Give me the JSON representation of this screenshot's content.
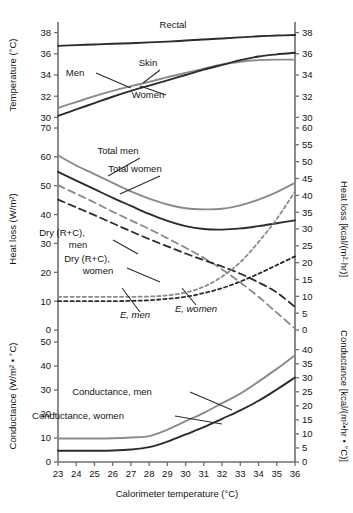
{
  "chart_data": {
    "type": "line",
    "title": "",
    "xlabel": "Calorimeter temperature (°C)",
    "xlim": [
      23,
      36
    ],
    "xticks": [
      23,
      24,
      25,
      26,
      27,
      28,
      29,
      30,
      31,
      32,
      33,
      34,
      35,
      36
    ],
    "x": [
      23,
      24,
      25,
      26,
      27,
      28,
      29,
      30,
      31,
      32,
      33,
      34,
      35,
      36
    ],
    "panels": [
      {
        "id": "temperature",
        "ylabel_left": "Temperature (°C)",
        "ylabel_right": "",
        "ylim_left": [
          29,
          39
        ],
        "yticks_left": [
          30,
          32,
          34,
          36,
          38
        ],
        "ylim_right": [
          29,
          39
        ],
        "yticks_right": [
          30,
          32,
          34,
          36,
          38
        ],
        "series": [
          {
            "name": "Rectal",
            "label": "Rectal",
            "style": "solid",
            "color": "#2b2b2b",
            "values": [
              36.75,
              36.82,
              36.88,
              36.95,
              37.0,
              37.08,
              37.15,
              37.25,
              37.35,
              37.45,
              37.55,
              37.65,
              37.72,
              37.78
            ]
          },
          {
            "name": "Skin, men",
            "label": "Men",
            "style": "solid",
            "color": "#8a8a8a",
            "values": [
              30.9,
              31.45,
              32.0,
              32.5,
              32.95,
              33.35,
              33.8,
              34.2,
              34.6,
              35.0,
              35.25,
              35.4,
              35.45,
              35.45
            ]
          },
          {
            "name": "Skin, women",
            "label": "Women",
            "style": "solid",
            "color": "#2b2b2b",
            "values": [
              30.15,
              30.75,
              31.35,
              31.95,
              32.5,
              33.0,
              33.5,
              34.0,
              34.5,
              34.95,
              35.4,
              35.75,
              35.95,
              36.1
            ]
          }
        ],
        "annotations": [
          {
            "text": "Rectal",
            "x": 173,
            "y": 28
          },
          {
            "text": "Skin",
            "x": 148,
            "y": 66
          },
          {
            "text": "Men",
            "x": 75,
            "y": 76
          },
          {
            "text": "Women",
            "x": 148,
            "y": 98
          }
        ]
      },
      {
        "id": "heat-loss",
        "ylabel_left": "Heat loss (W/m²)",
        "ylabel_right": "Heat loss [kcal/(m²·hr)]",
        "ylim_left": [
          0,
          70
        ],
        "yticks_left": [
          0,
          10,
          20,
          30,
          40,
          50,
          60,
          70
        ],
        "ylim_right": [
          0,
          60
        ],
        "yticks_right": [
          0,
          5,
          10,
          15,
          20,
          25,
          30,
          35,
          40,
          45,
          50,
          55,
          60
        ],
        "series": [
          {
            "name": "Total men",
            "label": "Total men",
            "style": "solid",
            "color": "#8a8a8a",
            "values": [
              60.5,
              57.0,
              54.0,
              51.0,
              48.0,
              45.5,
              43.5,
              42.2,
              41.8,
              42.0,
              43.2,
              45.2,
              47.8,
              51.0
            ]
          },
          {
            "name": "Total women",
            "label": "Total women",
            "style": "solid",
            "color": "#2b2b2b",
            "values": [
              54.8,
              51.8,
              48.8,
              45.8,
              43.0,
              40.2,
              37.8,
              36.0,
              35.0,
              34.8,
              35.2,
              36.0,
              37.0,
              38.0
            ]
          },
          {
            "name": "Dry (R+C), men",
            "label": "Dry (R+C), men",
            "style": "dashed",
            "color": "#8a8a8a",
            "values": [
              50.2,
              47.2,
              44.2,
              41.0,
              38.0,
              35.0,
              31.8,
              28.5,
              25.0,
              21.0,
              16.5,
              11.5,
              6.0,
              0.5
            ]
          },
          {
            "name": "Dry (R+C), women",
            "label": "Dry (R+C), women",
            "style": "dashed",
            "color": "#2b2b2b",
            "values": [
              45.2,
              42.5,
              39.8,
              37.0,
              34.2,
              31.5,
              29.0,
              26.5,
              24.2,
              22.0,
              19.5,
              16.5,
              13.0,
              8.0
            ]
          },
          {
            "name": "E, men",
            "label": "E, men",
            "style": "dotted",
            "color": "#8a8a8a",
            "values": [
              11.5,
              11.5,
              11.5,
              11.5,
              11.5,
              11.6,
              12.0,
              13.0,
              15.0,
              18.5,
              23.5,
              30.5,
              38.5,
              48.0
            ]
          },
          {
            "name": "E, women",
            "label": "E, women",
            "style": "dotted",
            "color": "#2b2b2b",
            "values": [
              10.0,
              10.0,
              10.0,
              10.0,
              10.1,
              10.3,
              10.8,
              11.5,
              12.8,
              14.5,
              16.8,
              19.5,
              22.5,
              25.5
            ]
          }
        ],
        "annotations": [
          {
            "text": "Total men",
            "x": 118,
            "y": 154
          },
          {
            "text": "Total women",
            "x": 135,
            "y": 172
          },
          {
            "text": "Dry (R+C),",
            "x": 62,
            "y": 236
          },
          {
            "text": "men",
            "x": 78,
            "y": 248
          },
          {
            "text": "Dry (R+C),",
            "x": 87,
            "y": 262
          },
          {
            "text": "women",
            "x": 98,
            "y": 274
          },
          {
            "text": "E, men",
            "x": 135,
            "y": 318
          },
          {
            "text": "E, women",
            "x": 196,
            "y": 312
          }
        ]
      },
      {
        "id": "conductance",
        "ylabel_left": "Conductance (W/m² • °C)",
        "ylabel_right": "Conductance [kcal/(m²•hr • °C)]",
        "ylim_left": [
          0,
          55
        ],
        "yticks_left": [
          0,
          10,
          20,
          30,
          40,
          50
        ],
        "ylim_right": [
          0,
          47
        ],
        "yticks_right": [
          0,
          5,
          10,
          15,
          20,
          25,
          30,
          35,
          40
        ],
        "series": [
          {
            "name": "Conductance, men",
            "label": "Conductance, men",
            "style": "solid",
            "color": "#8a8a8a",
            "values": [
              9.8,
              9.8,
              9.8,
              9.9,
              10.2,
              10.8,
              13.5,
              17.0,
              20.5,
              24.5,
              28.5,
              33.5,
              38.8,
              44.5
            ]
          },
          {
            "name": "Conductance, women",
            "label": "Conductance, women",
            "style": "solid",
            "color": "#2b2b2b",
            "values": [
              4.7,
              4.7,
              4.7,
              4.8,
              5.2,
              6.2,
              8.5,
              11.5,
              14.5,
              18.0,
              21.5,
              25.5,
              30.2,
              35.2
            ]
          }
        ],
        "annotations": [
          {
            "text": "Conductance, men",
            "x": 112,
            "y": 395
          },
          {
            "text": "Conductance, women",
            "x": 78,
            "y": 419
          }
        ]
      }
    ]
  }
}
